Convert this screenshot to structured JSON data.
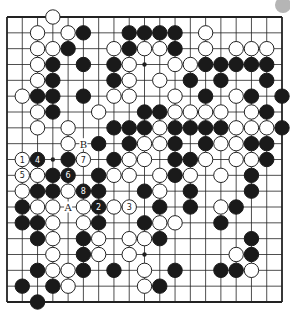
{
  "diagram": {
    "type": "go-board",
    "size": 19,
    "colors": {
      "background": "#ffffff",
      "line": "#222222",
      "black_stone": "#1a1a1a",
      "white_stone_fill": "#ffffff",
      "white_stone_stroke": "#222222",
      "corner_marker": "#b5b5b5"
    },
    "stones": [
      {
        "c": 3,
        "r": 0,
        "color": "W"
      },
      {
        "c": 2,
        "r": 1,
        "color": "W"
      },
      {
        "c": 4,
        "r": 1,
        "color": "W"
      },
      {
        "c": 5,
        "r": 1,
        "color": "B"
      },
      {
        "c": 8,
        "r": 1,
        "color": "B"
      },
      {
        "c": 9,
        "r": 1,
        "color": "B"
      },
      {
        "c": 10,
        "r": 1,
        "color": "B"
      },
      {
        "c": 11,
        "r": 1,
        "color": "B"
      },
      {
        "c": 13,
        "r": 1,
        "color": "W"
      },
      {
        "c": 2,
        "r": 2,
        "color": "W"
      },
      {
        "c": 3,
        "r": 2,
        "color": "W"
      },
      {
        "c": 4,
        "r": 2,
        "color": "B"
      },
      {
        "c": 7,
        "r": 2,
        "color": "W"
      },
      {
        "c": 8,
        "r": 2,
        "color": "B"
      },
      {
        "c": 9,
        "r": 2,
        "color": "W"
      },
      {
        "c": 10,
        "r": 2,
        "color": "W"
      },
      {
        "c": 11,
        "r": 2,
        "color": "B"
      },
      {
        "c": 13,
        "r": 2,
        "color": "W"
      },
      {
        "c": 15,
        "r": 2,
        "color": "W"
      },
      {
        "c": 16,
        "r": 2,
        "color": "W"
      },
      {
        "c": 17,
        "r": 2,
        "color": "W"
      },
      {
        "c": 2,
        "r": 3,
        "color": "W"
      },
      {
        "c": 3,
        "r": 3,
        "color": "B"
      },
      {
        "c": 5,
        "r": 3,
        "color": "B"
      },
      {
        "c": 7,
        "r": 3,
        "color": "B"
      },
      {
        "c": 8,
        "r": 3,
        "color": "W"
      },
      {
        "c": 11,
        "r": 3,
        "color": "W"
      },
      {
        "c": 12,
        "r": 3,
        "color": "W"
      },
      {
        "c": 13,
        "r": 3,
        "color": "B"
      },
      {
        "c": 14,
        "r": 3,
        "color": "B"
      },
      {
        "c": 15,
        "r": 3,
        "color": "B"
      },
      {
        "c": 16,
        "r": 3,
        "color": "B"
      },
      {
        "c": 17,
        "r": 3,
        "color": "B"
      },
      {
        "c": 2,
        "r": 4,
        "color": "W"
      },
      {
        "c": 3,
        "r": 4,
        "color": "B"
      },
      {
        "c": 7,
        "r": 4,
        "color": "B"
      },
      {
        "c": 8,
        "r": 4,
        "color": "W"
      },
      {
        "c": 10,
        "r": 4,
        "color": "W"
      },
      {
        "c": 12,
        "r": 4,
        "color": "B"
      },
      {
        "c": 14,
        "r": 4,
        "color": "B"
      },
      {
        "c": 17,
        "r": 4,
        "color": "B"
      },
      {
        "c": 1,
        "r": 5,
        "color": "W"
      },
      {
        "c": 2,
        "r": 5,
        "color": "B"
      },
      {
        "c": 3,
        "r": 5,
        "color": "B"
      },
      {
        "c": 5,
        "r": 5,
        "color": "B"
      },
      {
        "c": 7,
        "r": 5,
        "color": "W"
      },
      {
        "c": 8,
        "r": 5,
        "color": "W"
      },
      {
        "c": 11,
        "r": 5,
        "color": "W"
      },
      {
        "c": 13,
        "r": 5,
        "color": "B"
      },
      {
        "c": 15,
        "r": 5,
        "color": "W"
      },
      {
        "c": 16,
        "r": 5,
        "color": "B"
      },
      {
        "c": 18,
        "r": 5,
        "color": "B"
      },
      {
        "c": 2,
        "r": 6,
        "color": "W"
      },
      {
        "c": 3,
        "r": 6,
        "color": "B"
      },
      {
        "c": 6,
        "r": 6,
        "color": "W"
      },
      {
        "c": 9,
        "r": 6,
        "color": "B"
      },
      {
        "c": 10,
        "r": 6,
        "color": "B"
      },
      {
        "c": 11,
        "r": 6,
        "color": "W"
      },
      {
        "c": 12,
        "r": 6,
        "color": "W"
      },
      {
        "c": 13,
        "r": 6,
        "color": "W"
      },
      {
        "c": 14,
        "r": 6,
        "color": "W"
      },
      {
        "c": 16,
        "r": 6,
        "color": "W"
      },
      {
        "c": 17,
        "r": 6,
        "color": "B"
      },
      {
        "c": 2,
        "r": 7,
        "color": "W"
      },
      {
        "c": 4,
        "r": 7,
        "color": "W"
      },
      {
        "c": 7,
        "r": 7,
        "color": "B"
      },
      {
        "c": 8,
        "r": 7,
        "color": "B"
      },
      {
        "c": 9,
        "r": 7,
        "color": "B"
      },
      {
        "c": 10,
        "r": 7,
        "color": "W"
      },
      {
        "c": 11,
        "r": 7,
        "color": "B"
      },
      {
        "c": 12,
        "r": 7,
        "color": "B"
      },
      {
        "c": 13,
        "r": 7,
        "color": "B"
      },
      {
        "c": 14,
        "r": 7,
        "color": "B"
      },
      {
        "c": 15,
        "r": 7,
        "color": "W"
      },
      {
        "c": 16,
        "r": 7,
        "color": "W"
      },
      {
        "c": 17,
        "r": 7,
        "color": "W"
      },
      {
        "c": 18,
        "r": 7,
        "color": "B"
      },
      {
        "c": 4,
        "r": 8,
        "color": "W"
      },
      {
        "c": 6,
        "r": 8,
        "color": "B"
      },
      {
        "c": 8,
        "r": 8,
        "color": "B"
      },
      {
        "c": 9,
        "r": 8,
        "color": "W"
      },
      {
        "c": 10,
        "r": 8,
        "color": "W"
      },
      {
        "c": 11,
        "r": 8,
        "color": "B"
      },
      {
        "c": 13,
        "r": 8,
        "color": "B"
      },
      {
        "c": 14,
        "r": 8,
        "color": "W"
      },
      {
        "c": 15,
        "r": 8,
        "color": "W"
      },
      {
        "c": 16,
        "r": 8,
        "color": "B"
      },
      {
        "c": 17,
        "r": 8,
        "color": "B"
      },
      {
        "c": 1,
        "r": 9,
        "color": "W",
        "label": "1"
      },
      {
        "c": 2,
        "r": 9,
        "color": "B",
        "label": "4"
      },
      {
        "c": 4,
        "r": 9,
        "color": "B"
      },
      {
        "c": 5,
        "r": 9,
        "color": "W",
        "label": "7"
      },
      {
        "c": 7,
        "r": 9,
        "color": "B"
      },
      {
        "c": 8,
        "r": 9,
        "color": "W"
      },
      {
        "c": 9,
        "r": 9,
        "color": "W"
      },
      {
        "c": 11,
        "r": 9,
        "color": "B"
      },
      {
        "c": 12,
        "r": 9,
        "color": "B"
      },
      {
        "c": 13,
        "r": 9,
        "color": "W"
      },
      {
        "c": 15,
        "r": 9,
        "color": "W"
      },
      {
        "c": 16,
        "r": 9,
        "color": "W"
      },
      {
        "c": 17,
        "r": 9,
        "color": "B"
      },
      {
        "c": 1,
        "r": 10,
        "color": "W",
        "label": "5"
      },
      {
        "c": 2,
        "r": 10,
        "color": "W"
      },
      {
        "c": 3,
        "r": 10,
        "color": "B"
      },
      {
        "c": 4,
        "r": 10,
        "color": "B",
        "label": "6"
      },
      {
        "c": 6,
        "r": 10,
        "color": "B"
      },
      {
        "c": 7,
        "r": 10,
        "color": "W"
      },
      {
        "c": 8,
        "r": 10,
        "color": "W"
      },
      {
        "c": 10,
        "r": 10,
        "color": "W"
      },
      {
        "c": 11,
        "r": 10,
        "color": "B"
      },
      {
        "c": 12,
        "r": 10,
        "color": "W"
      },
      {
        "c": 14,
        "r": 10,
        "color": "W"
      },
      {
        "c": 16,
        "r": 10,
        "color": "B"
      },
      {
        "c": 1,
        "r": 11,
        "color": "W"
      },
      {
        "c": 2,
        "r": 11,
        "color": "B"
      },
      {
        "c": 3,
        "r": 11,
        "color": "B"
      },
      {
        "c": 4,
        "r": 11,
        "color": "W"
      },
      {
        "c": 5,
        "r": 11,
        "color": "B",
        "label": "8"
      },
      {
        "c": 6,
        "r": 11,
        "color": "B"
      },
      {
        "c": 9,
        "r": 11,
        "color": "B"
      },
      {
        "c": 10,
        "r": 11,
        "color": "W"
      },
      {
        "c": 12,
        "r": 11,
        "color": "B"
      },
      {
        "c": 16,
        "r": 11,
        "color": "B"
      },
      {
        "c": 1,
        "r": 12,
        "color": "B"
      },
      {
        "c": 2,
        "r": 12,
        "color": "W"
      },
      {
        "c": 3,
        "r": 12,
        "color": "W"
      },
      {
        "c": 5,
        "r": 12,
        "color": "W"
      },
      {
        "c": 6,
        "r": 12,
        "color": "B",
        "label": "2"
      },
      {
        "c": 7,
        "r": 12,
        "color": "W"
      },
      {
        "c": 8,
        "r": 12,
        "color": "W",
        "label": "3"
      },
      {
        "c": 10,
        "r": 12,
        "color": "B"
      },
      {
        "c": 12,
        "r": 12,
        "color": "B"
      },
      {
        "c": 14,
        "r": 12,
        "color": "W"
      },
      {
        "c": 15,
        "r": 12,
        "color": "B"
      },
      {
        "c": 1,
        "r": 13,
        "color": "B"
      },
      {
        "c": 2,
        "r": 13,
        "color": "B"
      },
      {
        "c": 3,
        "r": 13,
        "color": "W"
      },
      {
        "c": 5,
        "r": 13,
        "color": "W"
      },
      {
        "c": 6,
        "r": 13,
        "color": "B"
      },
      {
        "c": 9,
        "r": 13,
        "color": "B"
      },
      {
        "c": 10,
        "r": 13,
        "color": "W"
      },
      {
        "c": 11,
        "r": 13,
        "color": "W"
      },
      {
        "c": 14,
        "r": 13,
        "color": "B"
      },
      {
        "c": 2,
        "r": 14,
        "color": "B"
      },
      {
        "c": 3,
        "r": 14,
        "color": "W"
      },
      {
        "c": 5,
        "r": 14,
        "color": "B"
      },
      {
        "c": 6,
        "r": 14,
        "color": "W"
      },
      {
        "c": 8,
        "r": 14,
        "color": "W"
      },
      {
        "c": 9,
        "r": 14,
        "color": "W"
      },
      {
        "c": 10,
        "r": 14,
        "color": "B"
      },
      {
        "c": 16,
        "r": 14,
        "color": "B"
      },
      {
        "c": 3,
        "r": 15,
        "color": "W"
      },
      {
        "c": 5,
        "r": 15,
        "color": "B"
      },
      {
        "c": 6,
        "r": 15,
        "color": "W"
      },
      {
        "c": 8,
        "r": 15,
        "color": "W"
      },
      {
        "c": 15,
        "r": 15,
        "color": "W"
      },
      {
        "c": 16,
        "r": 15,
        "color": "B"
      },
      {
        "c": 2,
        "r": 16,
        "color": "B"
      },
      {
        "c": 3,
        "r": 16,
        "color": "W"
      },
      {
        "c": 4,
        "r": 16,
        "color": "W"
      },
      {
        "c": 5,
        "r": 16,
        "color": "B"
      },
      {
        "c": 7,
        "r": 16,
        "color": "B"
      },
      {
        "c": 9,
        "r": 16,
        "color": "W"
      },
      {
        "c": 11,
        "r": 16,
        "color": "B"
      },
      {
        "c": 14,
        "r": 16,
        "color": "B"
      },
      {
        "c": 15,
        "r": 16,
        "color": "B"
      },
      {
        "c": 16,
        "r": 16,
        "color": "W"
      },
      {
        "c": 1,
        "r": 17,
        "color": "B"
      },
      {
        "c": 3,
        "r": 17,
        "color": "B"
      },
      {
        "c": 4,
        "r": 17,
        "color": "W"
      },
      {
        "c": 9,
        "r": 17,
        "color": "W"
      },
      {
        "c": 10,
        "r": 17,
        "color": "B"
      },
      {
        "c": 2,
        "r": 18,
        "color": "B"
      }
    ],
    "marks": [
      {
        "c": 5,
        "r": 8,
        "text": "B"
      },
      {
        "c": 4,
        "r": 12,
        "text": "A"
      }
    ],
    "star_points": [
      {
        "c": 3,
        "r": 3
      },
      {
        "c": 9,
        "r": 3
      },
      {
        "c": 15,
        "r": 3
      },
      {
        "c": 3,
        "r": 9
      },
      {
        "c": 9,
        "r": 9
      },
      {
        "c": 15,
        "r": 9
      },
      {
        "c": 3,
        "r": 15
      },
      {
        "c": 9,
        "r": 15
      },
      {
        "c": 15,
        "r": 15
      }
    ],
    "move_labels": [
      "1",
      "2",
      "3",
      "4",
      "5",
      "6",
      "7",
      "8"
    ],
    "point_labels": [
      "A",
      "B"
    ]
  }
}
